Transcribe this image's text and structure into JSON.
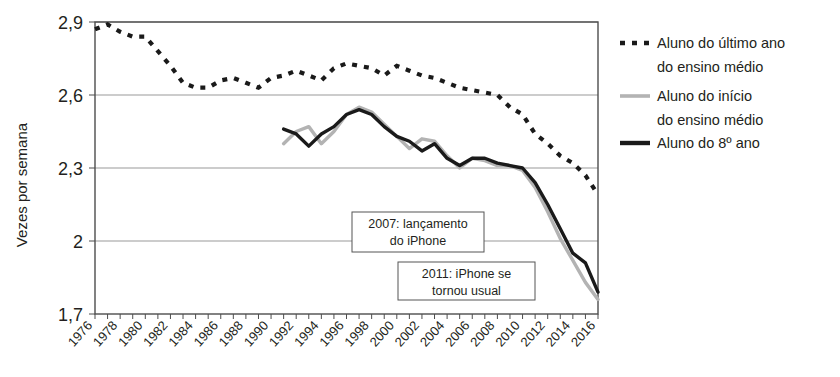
{
  "chart_data": {
    "type": "line",
    "title": "",
    "xlabel": "",
    "ylabel": "Vezes por semana",
    "xlim": [
      1976,
      2016
    ],
    "ylim": [
      1.7,
      2.9
    ],
    "yticks": [
      "1,7",
      "2",
      "2,3",
      "2,6",
      "2,9"
    ],
    "ytick_values": [
      1.7,
      2.0,
      2.3,
      2.6,
      2.9
    ],
    "xticks": [
      "1976",
      "1978",
      "1980",
      "1982",
      "1984",
      "1986",
      "1988",
      "1990",
      "1992",
      "1994",
      "1996",
      "1998",
      "2000",
      "2002",
      "2004",
      "2006",
      "2008",
      "2010",
      "2012",
      "2014",
      "2016"
    ],
    "grid": true,
    "legend_position": "right",
    "series": [
      {
        "name": "Aluno do último ano do ensino médio",
        "style": "dotted",
        "color": "#1a1a1a",
        "x": [
          1976,
          1977,
          1978,
          1979,
          1980,
          1981,
          1982,
          1983,
          1984,
          1985,
          1986,
          1987,
          1988,
          1989,
          1990,
          1991,
          1992,
          1993,
          1994,
          1995,
          1996,
          1997,
          1998,
          1999,
          2000,
          2001,
          2002,
          2003,
          2004,
          2005,
          2006,
          2007,
          2008,
          2009,
          2010,
          2011,
          2012,
          2013,
          2014,
          2015,
          2016
        ],
        "values": [
          2.87,
          2.89,
          2.86,
          2.84,
          2.84,
          2.78,
          2.72,
          2.65,
          2.63,
          2.63,
          2.66,
          2.67,
          2.65,
          2.63,
          2.67,
          2.68,
          2.7,
          2.68,
          2.66,
          2.71,
          2.73,
          2.72,
          2.71,
          2.68,
          2.72,
          2.7,
          2.68,
          2.67,
          2.65,
          2.63,
          2.62,
          2.61,
          2.6,
          2.55,
          2.52,
          2.44,
          2.4,
          2.35,
          2.32,
          2.27,
          2.19
        ]
      },
      {
        "name": "Aluno do início do ensino médio",
        "style": "solid-light",
        "color": "#b3b3b3",
        "x": [
          1991,
          1992,
          1993,
          1994,
          1995,
          1996,
          1997,
          1998,
          1999,
          2000,
          2001,
          2002,
          2003,
          2004,
          2005,
          2006,
          2007,
          2008,
          2009,
          2010,
          2011,
          2012,
          2013,
          2014,
          2015,
          2016
        ],
        "values": [
          2.4,
          2.45,
          2.47,
          2.4,
          2.45,
          2.52,
          2.55,
          2.53,
          2.48,
          2.43,
          2.38,
          2.42,
          2.41,
          2.35,
          2.3,
          2.34,
          2.33,
          2.31,
          2.31,
          2.29,
          2.22,
          2.12,
          2.01,
          1.92,
          1.83,
          1.76
        ]
      },
      {
        "name": "Aluno do 8º ano",
        "style": "solid-dark",
        "color": "#1a1a1a",
        "x": [
          1991,
          1992,
          1993,
          1994,
          1995,
          1996,
          1997,
          1998,
          1999,
          2000,
          2001,
          2002,
          2003,
          2004,
          2005,
          2006,
          2007,
          2008,
          2009,
          2010,
          2011,
          2012,
          2013,
          2014,
          2015,
          2016
        ],
        "values": [
          2.46,
          2.44,
          2.39,
          2.44,
          2.47,
          2.52,
          2.54,
          2.52,
          2.47,
          2.43,
          2.41,
          2.37,
          2.4,
          2.34,
          2.31,
          2.34,
          2.34,
          2.32,
          2.31,
          2.3,
          2.24,
          2.15,
          2.05,
          1.95,
          1.91,
          1.79
        ]
      }
    ],
    "annotations": [
      {
        "id": "annotation-2007",
        "lines": [
          "2007: lançamento",
          "do iPhone"
        ],
        "year": 2007
      },
      {
        "id": "annotation-2011",
        "lines": [
          "2011: iPhone se",
          "tornou usual"
        ],
        "year": 2011
      }
    ]
  },
  "legend": {
    "items": [
      {
        "line1": "Aluno do último ano",
        "line2": "do ensino médio",
        "marker": "dotted-line-icon"
      },
      {
        "line1": "Aluno do início",
        "line2": "do ensino médio",
        "marker": "light-line-icon"
      },
      {
        "line1": "Aluno do 8º ano",
        "line2": "",
        "marker": "dark-line-icon"
      }
    ]
  }
}
